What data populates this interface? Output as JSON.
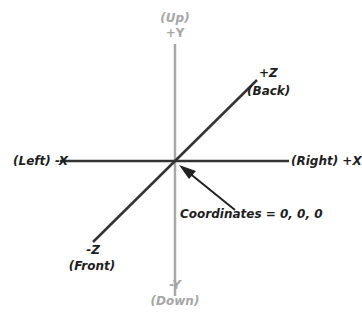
{
  "diagram": {
    "colors": {
      "dark_axis": "#333333",
      "grey_axis": "#a8a8a8",
      "text_dark": "#1e1e1e",
      "text_grey": "#a6a6a6"
    },
    "y_axis": {
      "pos_label": "+Y",
      "pos_name": "(Up)",
      "neg_label": "-Y",
      "neg_name": "(Down)"
    },
    "x_axis": {
      "neg_text": "(Left) -X",
      "pos_text": "(Right) +X"
    },
    "z_axis": {
      "pos_label": "+Z",
      "pos_name": "(Back)",
      "neg_label": "-Z",
      "neg_name": "(Front)"
    },
    "origin_annotation": "Coordinates = 0, 0, 0"
  }
}
